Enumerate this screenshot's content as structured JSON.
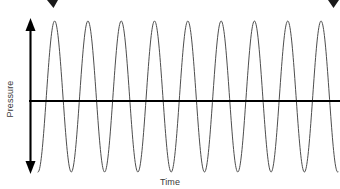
{
  "figure": {
    "background_color": "#ffffff",
    "width": 340,
    "height": 189
  },
  "labels": {
    "ylabel": "Pressure",
    "xlabel": "Time",
    "label_color": "#3a3a3a"
  },
  "axes": {
    "vertical_axis": {
      "name": "pressure-axis",
      "style": "double-headed-arrow",
      "color": "#000000",
      "x": 30,
      "y_top": 20,
      "y_bottom": 172,
      "stroke_width": 2
    },
    "horizontal_axis": {
      "name": "time-axis",
      "style": "line",
      "color": "#000000",
      "y": 101,
      "x_start": 30,
      "x_end": 340,
      "stroke_width": 2
    }
  },
  "top_arrow": {
    "name": "wavelength-span-arrow",
    "description": "double-headed horizontal arrow cropped by top image edge",
    "color": "#1a1a1a",
    "y": 2,
    "x_left_head": 50,
    "x_right_head": 333
  },
  "chart_data": {
    "type": "line",
    "title": "",
    "xlabel": "Time",
    "ylabel": "Pressure",
    "grid": false,
    "legend": null,
    "axis_ticks": {
      "x": [],
      "y": []
    },
    "xlim": [
      0,
      9.45
    ],
    "ylim": [
      -1,
      1
    ],
    "series": [
      {
        "name": "pressure-waveform",
        "waveform": "sine",
        "color": "#4d4d4d",
        "stroke_width": 1,
        "amplitude": 1,
        "cycles": 9,
        "period_px": 33.3,
        "phase_deg": -90,
        "baseline_value": 0,
        "x_start_px": 38,
        "x_end_px": 338,
        "peak_y_px": 21,
        "trough_y_px": 172,
        "peaks_x_px": [
          54,
          87,
          121,
          154,
          187,
          220,
          254,
          287,
          320
        ],
        "troughs_x_px": [
          38,
          71,
          104,
          137,
          171,
          204,
          237,
          270,
          304,
          337
        ],
        "values_label": "constant amplitude, constant frequency"
      }
    ]
  }
}
